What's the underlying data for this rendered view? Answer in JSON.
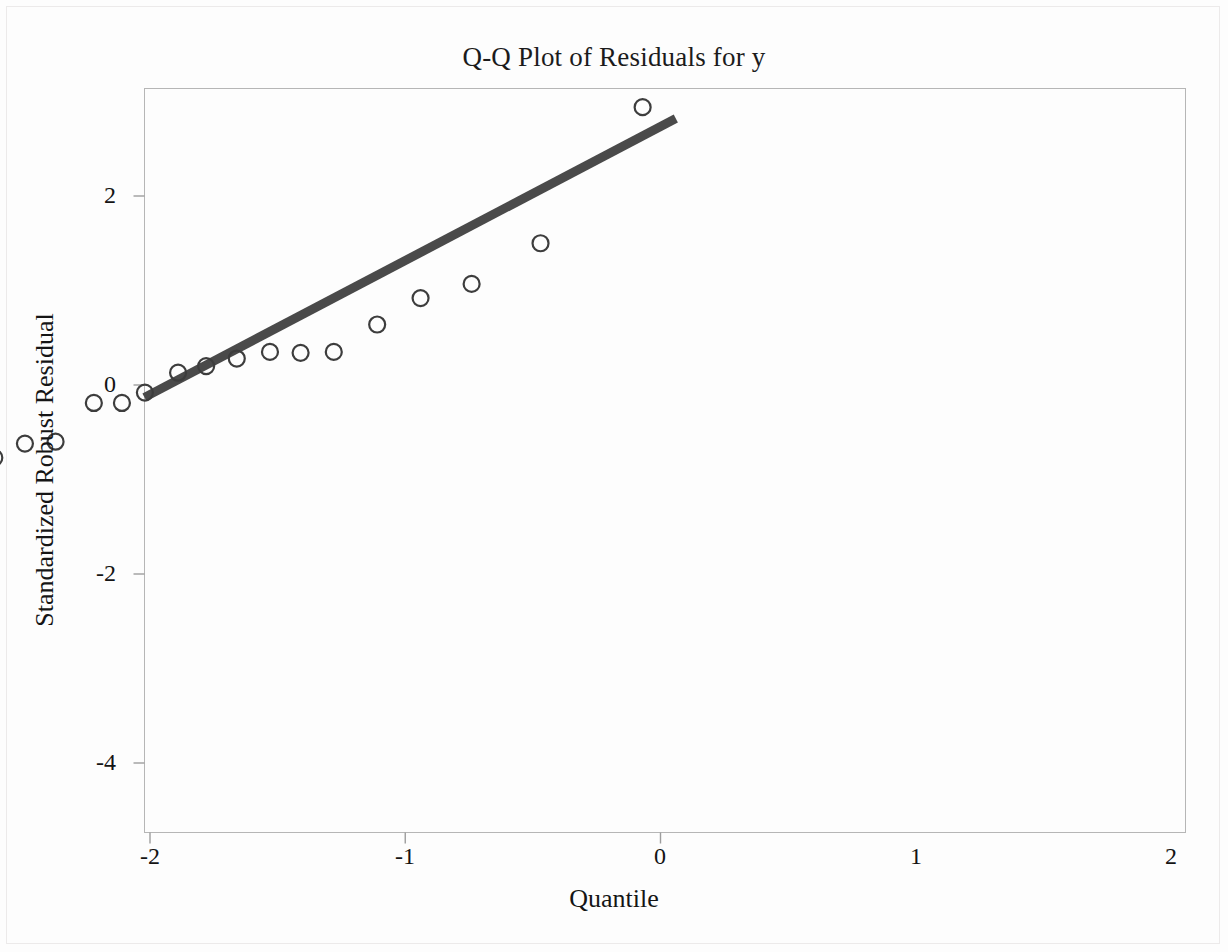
{
  "figure": {
    "title": "Q-Q Plot of Residuals for y",
    "background_color": "#fdfdfd",
    "frame_color": "#b4b4b4",
    "marker_color": "#3d3d3d",
    "line_color": "#4a4a4a"
  },
  "axes": {
    "x_label": "Quantile",
    "y_label": "Standardized Robust Residual",
    "x_ticks": [
      "-2",
      "-1",
      "0",
      "1",
      "2"
    ],
    "y_ticks": [
      "2",
      "0",
      "-2",
      "-4"
    ]
  },
  "chart_data": {
    "type": "scatter",
    "title": "Q-Q Plot of Residuals for y",
    "xlabel": "Quantile",
    "ylabel": "Standardized Robust Residual",
    "xlim": [
      -2.13,
      2.06
    ],
    "ylim": [
      -4.88,
      3.14
    ],
    "xticks": [
      -2,
      -1,
      0,
      1,
      2
    ],
    "yticks": [
      2,
      0,
      -2,
      -4
    ],
    "grid": false,
    "legend": "none",
    "series": [
      {
        "name": "Standardized robust residuals vs normal quantiles",
        "marker": "open-circle",
        "points": [
          {
            "x": -1.89,
            "y": -4.52
          },
          {
            "x": -1.42,
            "y": -1.3
          },
          {
            "x": -1.14,
            "y": -1.13
          },
          {
            "x": -0.93,
            "y": -1.06
          },
          {
            "x": -0.75,
            "y": -0.78
          },
          {
            "x": -0.61,
            "y": -0.77
          },
          {
            "x": -0.49,
            "y": -0.62
          },
          {
            "x": -0.37,
            "y": -0.6
          },
          {
            "x": -0.22,
            "y": -0.19
          },
          {
            "x": -0.11,
            "y": -0.19
          },
          {
            "x": -0.02,
            "y": -0.08
          },
          {
            "x": 0.11,
            "y": 0.13
          },
          {
            "x": 0.22,
            "y": 0.2
          },
          {
            "x": 0.34,
            "y": 0.28
          },
          {
            "x": 0.47,
            "y": 0.35
          },
          {
            "x": 0.59,
            "y": 0.34
          },
          {
            "x": 0.72,
            "y": 0.35
          },
          {
            "x": 0.89,
            "y": 0.64
          },
          {
            "x": 1.06,
            "y": 0.92
          },
          {
            "x": 1.26,
            "y": 1.07
          },
          {
            "x": 1.53,
            "y": 1.5
          },
          {
            "x": 1.93,
            "y": 2.94
          }
        ]
      }
    ],
    "reference_line": {
      "name": "normal reference line",
      "x": [
        -2.13,
        2.06
      ],
      "y": [
        -3.12,
        2.82
      ],
      "slope": 1.417,
      "intercept": -0.1
    }
  }
}
